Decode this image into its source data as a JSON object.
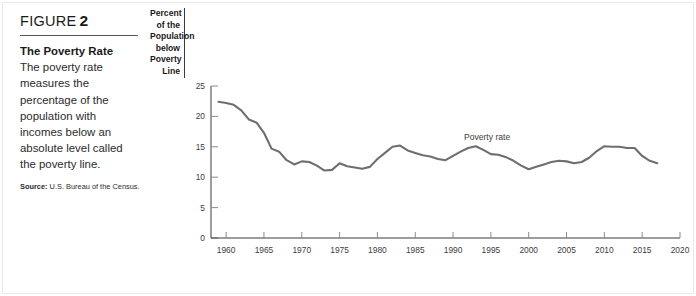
{
  "figure": {
    "eyebrow_word": "FIGURE",
    "number": "2",
    "title": "The Poverty Rate",
    "body": "The poverty rate measures the percentage of the population with incomes below an absolute level called the poverty line.",
    "source_label": "Source:",
    "source_text": "U.S. Bureau of the Census."
  },
  "chart_data": {
    "type": "line",
    "title": "The Poverty Rate",
    "xlabel": "",
    "ylabel": "Percent of the Population below Poverty Line",
    "ylabel_lines": [
      "Percent of the",
      "Population",
      "below Poverty",
      "Line"
    ],
    "xlim": [
      1958,
      2020
    ],
    "ylim": [
      0,
      25
    ],
    "yticks": [
      0,
      5,
      10,
      15,
      20,
      25
    ],
    "ytick_labels": [
      "0",
      "5",
      "10",
      "15",
      "20",
      "25"
    ],
    "xticks": [
      1960,
      1965,
      1970,
      1975,
      1980,
      1985,
      1990,
      1995,
      2000,
      2005,
      2010,
      2015,
      2020
    ],
    "xtick_labels": [
      "1960",
      "1965",
      "1970",
      "1975",
      "1980",
      "1985",
      "1990",
      "1995",
      "2000",
      "2005",
      "2010",
      "2015",
      "2020"
    ],
    "grid": false,
    "legend_position": "inline-annotation",
    "annotations": [
      {
        "text": "Poverty rate",
        "x": 1994.5,
        "y": 16.1
      }
    ],
    "line_color": "#6e6e6e",
    "line_width": 2.1,
    "series": [
      {
        "name": "Poverty rate",
        "x": [
          1959,
          1960,
          1961,
          1962,
          1963,
          1964,
          1965,
          1966,
          1967,
          1968,
          1969,
          1970,
          1971,
          1972,
          1973,
          1974,
          1975,
          1976,
          1977,
          1978,
          1979,
          1980,
          1981,
          1982,
          1983,
          1984,
          1985,
          1986,
          1987,
          1988,
          1989,
          1990,
          1991,
          1992,
          1993,
          1994,
          1995,
          1996,
          1997,
          1998,
          1999,
          2000,
          2001,
          2002,
          2003,
          2004,
          2005,
          2006,
          2007,
          2008,
          2009,
          2010,
          2011,
          2012,
          2013,
          2014,
          2015,
          2016,
          2017
        ],
        "values": [
          22.4,
          22.2,
          21.9,
          21.0,
          19.5,
          19.0,
          17.3,
          14.7,
          14.2,
          12.8,
          12.1,
          12.6,
          12.5,
          11.9,
          11.1,
          11.2,
          12.3,
          11.8,
          11.6,
          11.4,
          11.7,
          13.0,
          14.0,
          15.0,
          15.2,
          14.4,
          14.0,
          13.6,
          13.4,
          13.0,
          12.8,
          13.5,
          14.2,
          14.8,
          15.1,
          14.5,
          13.8,
          13.7,
          13.3,
          12.7,
          11.9,
          11.3,
          11.7,
          12.1,
          12.5,
          12.7,
          12.6,
          12.3,
          12.5,
          13.2,
          14.3,
          15.1,
          15.0,
          15.0,
          14.8,
          14.8,
          13.5,
          12.7,
          12.3
        ]
      }
    ]
  }
}
